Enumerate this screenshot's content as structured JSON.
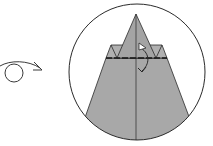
{
  "diagram": {
    "type": "origami-step",
    "symbols": {
      "turn_over": "turn-over-icon",
      "fold_arrow": "valley-fold-arrow-icon"
    },
    "colors": {
      "paper": "#a8a8a8",
      "paper_light": "#b4b4b4",
      "line": "#2a2a2a",
      "background": "#ffffff"
    }
  }
}
